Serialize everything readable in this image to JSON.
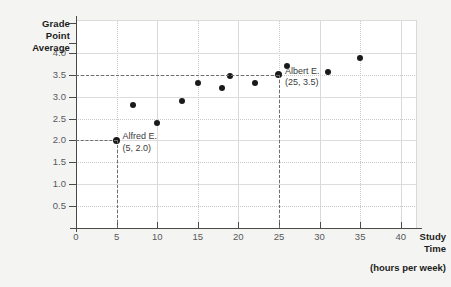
{
  "chart_data": {
    "type": "scatter",
    "title": "",
    "xlabel": "Study Time",
    "xlabel_sub": "(hours per week)",
    "ylabel": "Grade Point Average",
    "ylabel_lines": [
      "Grade",
      "Point",
      "Average"
    ],
    "xlabel_lines": [
      "Study",
      "Time"
    ],
    "xlim": [
      0,
      42
    ],
    "ylim": [
      0,
      4.75
    ],
    "x_ticks": [
      0,
      5,
      10,
      15,
      20,
      25,
      30,
      35,
      40
    ],
    "x_tick_labels": [
      "0",
      "5",
      "10",
      "15",
      "20",
      "25",
      "30",
      "35",
      "40"
    ],
    "y_ticks": [
      0.5,
      1.0,
      1.5,
      2.0,
      2.5,
      3.0,
      3.5,
      4.0
    ],
    "y_tick_labels": [
      "0.5",
      "1.0",
      "1.5",
      "2.0",
      "2.5",
      "3.0",
      "3.5",
      "4.0"
    ],
    "x_major_gridlines": [
      0,
      10,
      20,
      30,
      40
    ],
    "x_minor_gridlines": [
      5,
      15,
      25,
      35
    ],
    "y_major_gridlines": [
      1.0,
      2.0,
      3.0,
      4.0
    ],
    "y_minor_gridlines": [
      0.5,
      1.5,
      2.5,
      3.5
    ],
    "grid": true,
    "legend": false,
    "point_color": "#1a1a1a",
    "axis_color": "#4a4a4a",
    "background": "#f4f4f3",
    "plot_background": "#ffffff",
    "points": [
      {
        "x": 5,
        "y": 2.0,
        "label": "Alfred E.",
        "highlight": true
      },
      {
        "x": 7,
        "y": 2.8,
        "label": "",
        "highlight": false
      },
      {
        "x": 10,
        "y": 2.4,
        "label": "",
        "highlight": false
      },
      {
        "x": 13,
        "y": 2.9,
        "label": "",
        "highlight": false
      },
      {
        "x": 15,
        "y": 3.3,
        "label": "",
        "highlight": false
      },
      {
        "x": 18,
        "y": 3.2,
        "label": "",
        "highlight": false
      },
      {
        "x": 19,
        "y": 3.47,
        "label": "",
        "highlight": false
      },
      {
        "x": 22,
        "y": 3.3,
        "label": "",
        "highlight": false
      },
      {
        "x": 25,
        "y": 3.5,
        "label": "Albert E.",
        "highlight": true
      },
      {
        "x": 26,
        "y": 3.7,
        "label": "",
        "highlight": false
      },
      {
        "x": 31,
        "y": 3.57,
        "label": "",
        "highlight": false
      },
      {
        "x": 35,
        "y": 3.88,
        "label": "",
        "highlight": false
      }
    ],
    "annotations": [
      {
        "name": "alfred",
        "title": "Alfred E.",
        "coords": "(5, 2.0)",
        "point_x": 5,
        "point_y": 2.0
      },
      {
        "name": "albert",
        "title": "Albert E.",
        "coords": "(25, 3.5)",
        "point_x": 25,
        "point_y": 3.5
      }
    ]
  }
}
